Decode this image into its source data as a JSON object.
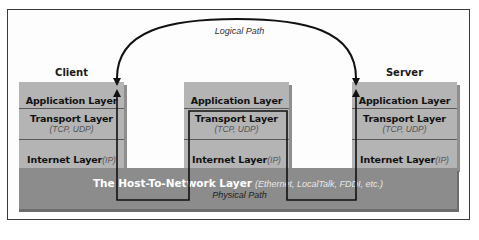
{
  "diagram": {
    "logical_path_label": "Logical Path",
    "physical_path_label": "Physical Path",
    "stacks": [
      {
        "label": "Client",
        "layers": [
          {
            "name": "Application Layer",
            "sub": ""
          },
          {
            "name": "Transport Layer",
            "sub": "(TCP, UDP)"
          },
          {
            "name": "Internet Layer",
            "sub": "(IP)"
          }
        ]
      },
      {
        "label": "",
        "layers": [
          {
            "name": "Application Layer",
            "sub": ""
          },
          {
            "name": "Transport Layer",
            "sub": "(TCP, UDP)"
          },
          {
            "name": "Internet Layer",
            "sub": "(IP)"
          }
        ]
      },
      {
        "label": "Server",
        "layers": [
          {
            "name": "Application Layer",
            "sub": ""
          },
          {
            "name": "Transport Layer",
            "sub": "(TCP, UDP)"
          },
          {
            "name": "Internet Layer",
            "sub": "(IP)"
          }
        ]
      }
    ],
    "host_layer": {
      "name": "The Host-To-Network Layer",
      "sub": "(Ethernet, LocalTalk, FDDI, etc.)"
    },
    "colors": {
      "layer_fill": "#b4b4b4",
      "host_fill": "#8c8c8c",
      "line": "#111111"
    }
  }
}
